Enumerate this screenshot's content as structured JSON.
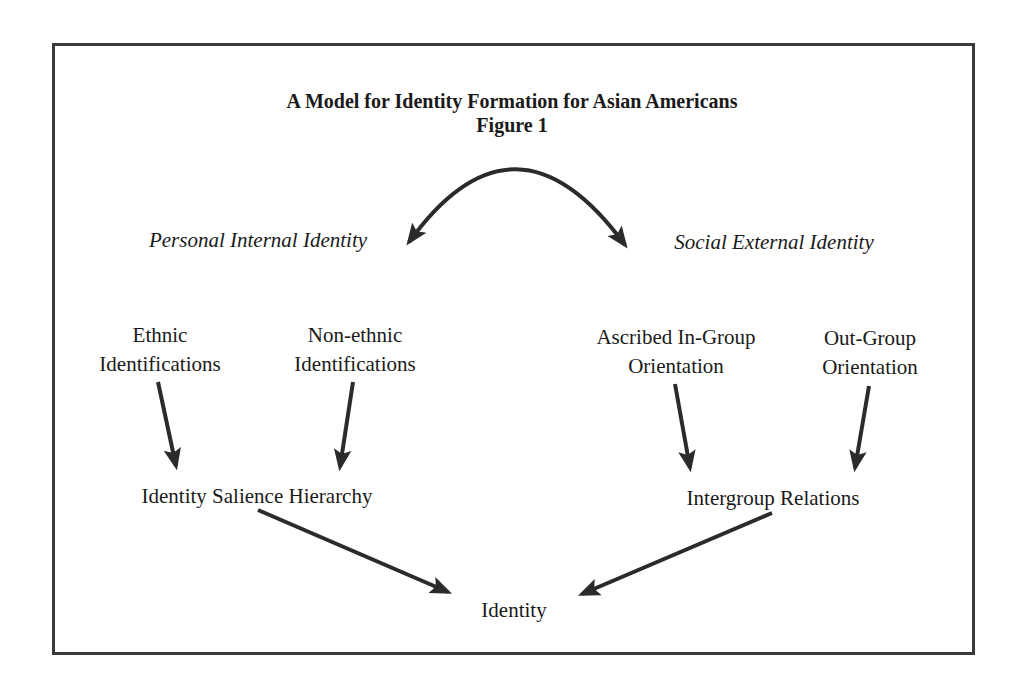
{
  "figure": {
    "title": "A Model for Identity Formation for Asian Americans",
    "subtitle": "Figure 1"
  },
  "branches": {
    "personal": {
      "label": "Personal Internal Identity"
    },
    "social": {
      "label": "Social External Identity"
    }
  },
  "nodes": {
    "ethnic": {
      "line1": "Ethnic",
      "line2": "Identifications"
    },
    "non_ethnic": {
      "line1": "Non-ethnic",
      "line2": "Identifications"
    },
    "ascribed": {
      "line1": "Ascribed In-Group",
      "line2": "Orientation"
    },
    "out_group": {
      "line1": "Out-Group",
      "line2": "Orientation"
    },
    "salience": {
      "label": "Identity Salience Hierarchy"
    },
    "intergroup": {
      "label": "Intergroup Relations"
    },
    "identity": {
      "label": "Identity"
    }
  },
  "edges": [
    {
      "from": "personal",
      "to": "social",
      "type": "bidirectional-arc"
    },
    {
      "from": "ethnic",
      "to": "salience"
    },
    {
      "from": "non_ethnic",
      "to": "salience"
    },
    {
      "from": "ascribed",
      "to": "intergroup"
    },
    {
      "from": "out_group",
      "to": "intergroup"
    },
    {
      "from": "salience",
      "to": "identity"
    },
    {
      "from": "intergroup",
      "to": "identity"
    }
  ],
  "colors": {
    "stroke": "#2b2b2b",
    "frame": "#3a3a3a",
    "text": "#1a1a1a",
    "background": "#ffffff"
  }
}
